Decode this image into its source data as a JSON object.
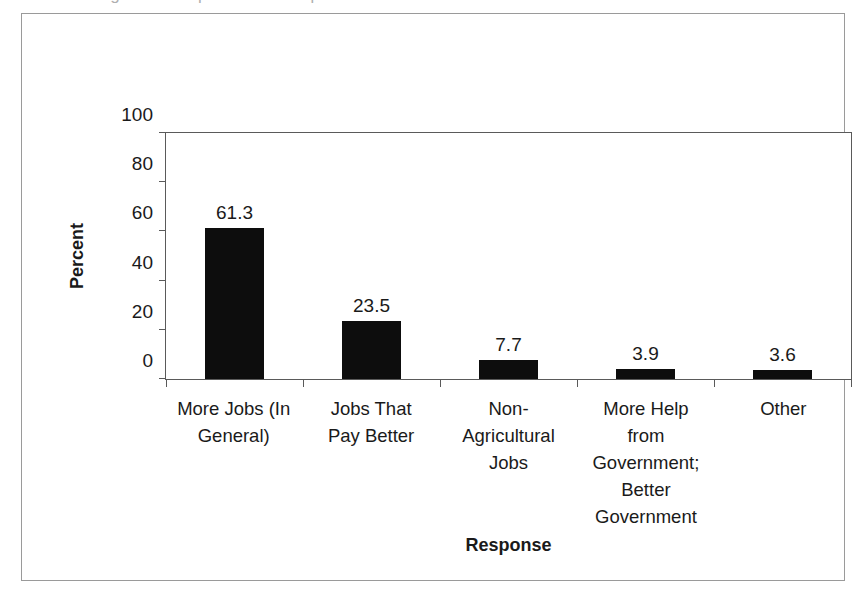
{
  "figure": {
    "caption_sliver": "Figure 4. Responses to the question of what is most needed",
    "background_color": "#ffffff",
    "frame_color": "#9a9a9a",
    "axis_color": "#5a5a5a",
    "bar_color": "#0d0d0d"
  },
  "chart_data": {
    "type": "bar",
    "title": "",
    "xlabel": "Response",
    "ylabel": "Percent",
    "categories": [
      "More Jobs (In General)",
      "Jobs That Pay Better",
      "Non-Agricultural Jobs",
      "More Help from Government; Better Government",
      "Other"
    ],
    "category_display": [
      "More Jobs (In\nGeneral)",
      "Jobs That\nPay Better",
      "Non-\nAgricultural\nJobs",
      "More Help\nfrom\nGovernment;\nBetter\nGovernment",
      "Other"
    ],
    "values": [
      61.3,
      23.5,
      7.7,
      3.9,
      3.6
    ],
    "value_labels": [
      "61.3",
      "23.5",
      "7.7",
      "3.9",
      "3.6"
    ],
    "ylim": [
      0,
      100
    ],
    "yticks": [
      0,
      20,
      40,
      60,
      80,
      100
    ],
    "ytick_labels": [
      "0",
      "20",
      "40",
      "60",
      "80",
      "100"
    ],
    "grid": false,
    "legend": null
  }
}
